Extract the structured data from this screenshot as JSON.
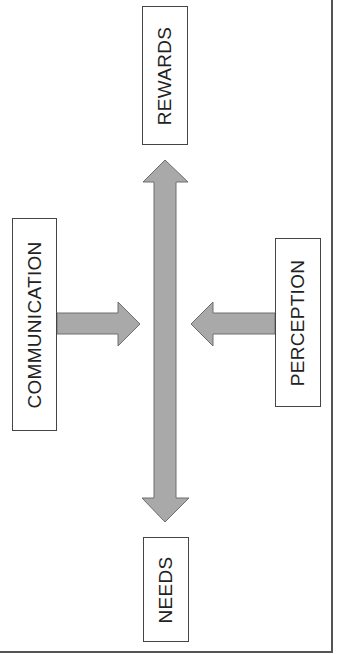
{
  "diagram": {
    "nodes": {
      "rewards": {
        "label": "REWARDS"
      },
      "needs": {
        "label": "NEEDS"
      },
      "communication": {
        "label": "COMMUNICATION"
      },
      "perception": {
        "label": "PERCEPTION"
      }
    },
    "edges": [
      {
        "from": "needs",
        "to": "rewards",
        "type": "double-headed"
      },
      {
        "from": "communication",
        "to": "center-axis",
        "type": "single-headed"
      },
      {
        "from": "perception",
        "to": "center-axis",
        "type": "single-headed"
      }
    ],
    "colors": {
      "arrow_fill": "#a9a9a9",
      "arrow_stroke": "#6e6e6e",
      "box_border": "#444444",
      "text": "#222222"
    }
  }
}
